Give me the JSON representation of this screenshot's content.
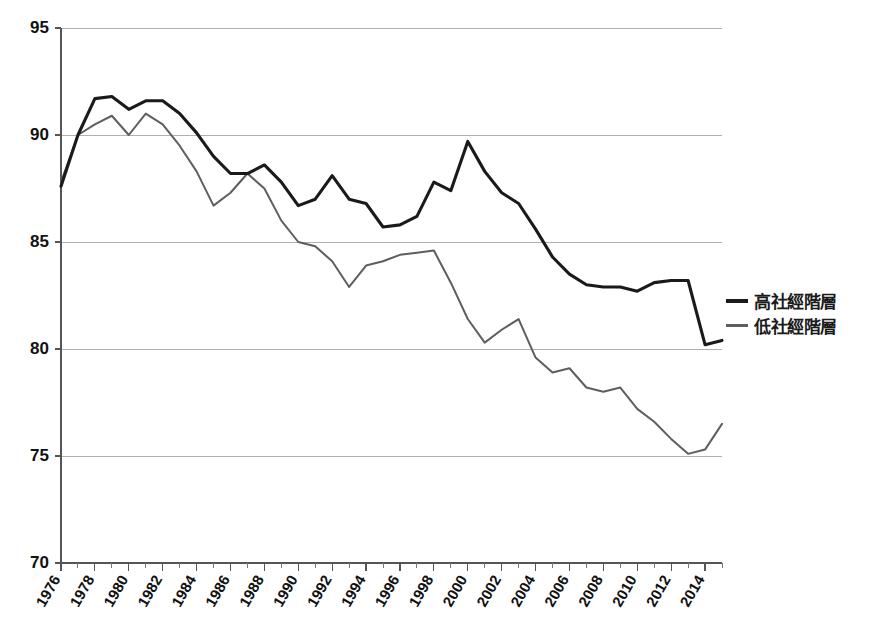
{
  "chart_data": {
    "type": "line",
    "title": "",
    "subtitle": "",
    "xlabel": "",
    "ylabel": "",
    "grid": true,
    "legend_position": "right",
    "ylim": [
      70,
      95
    ],
    "yticks": [
      70,
      75,
      80,
      85,
      90,
      95
    ],
    "xlim": [
      1976,
      2015
    ],
    "xticks": [
      1976,
      1978,
      1980,
      1982,
      1984,
      1986,
      1988,
      1990,
      1992,
      1994,
      1996,
      1998,
      2000,
      2002,
      2004,
      2006,
      2008,
      2010,
      2012,
      2014
    ],
    "xticks_minor": [
      1977,
      1979,
      1981,
      1983,
      1985,
      1987,
      1989,
      1991,
      1993,
      1995,
      1997,
      1999,
      2001,
      2003,
      2005,
      2007,
      2009,
      2011,
      2013,
      2015
    ],
    "x": [
      1976,
      1977,
      1978,
      1979,
      1980,
      1981,
      1982,
      1983,
      1984,
      1985,
      1986,
      1987,
      1988,
      1989,
      1990,
      1991,
      1992,
      1993,
      1994,
      1995,
      1996,
      1997,
      1998,
      1999,
      2000,
      2001,
      2002,
      2003,
      2004,
      2005,
      2006,
      2007,
      2008,
      2009,
      2010,
      2011,
      2012,
      2013,
      2014,
      2015
    ],
    "series": [
      {
        "name": "高社經階層",
        "color": "#1a1a1a",
        "values": [
          87.6,
          90.0,
          91.7,
          91.8,
          91.2,
          91.6,
          91.6,
          91.0,
          90.1,
          89.0,
          88.2,
          88.2,
          88.6,
          87.8,
          86.7,
          87.0,
          88.1,
          87.0,
          86.8,
          85.7,
          85.8,
          86.2,
          87.8,
          87.4,
          89.7,
          88.3,
          87.3,
          86.8,
          85.6,
          84.3,
          83.5,
          83.0,
          82.9,
          82.9,
          82.7,
          83.1,
          83.2,
          83.2,
          80.2,
          80.4
        ]
      },
      {
        "name": "低社經階層",
        "color": "#5e5e5e",
        "values": [
          87.8,
          90.0,
          90.5,
          90.9,
          90.0,
          91.0,
          90.5,
          89.5,
          88.3,
          86.7,
          87.3,
          88.2,
          87.5,
          86.0,
          85.0,
          84.8,
          84.1,
          82.9,
          83.9,
          84.1,
          84.4,
          84.5,
          84.6,
          83.1,
          81.4,
          80.3,
          80.9,
          81.4,
          79.6,
          78.9,
          79.1,
          78.2,
          78.0,
          78.2,
          77.2,
          76.6,
          75.8,
          75.1,
          75.3,
          76.5
        ]
      }
    ]
  },
  "legend": {
    "items": [
      {
        "label": "高社經階層"
      },
      {
        "label": "低社經階層"
      }
    ]
  }
}
